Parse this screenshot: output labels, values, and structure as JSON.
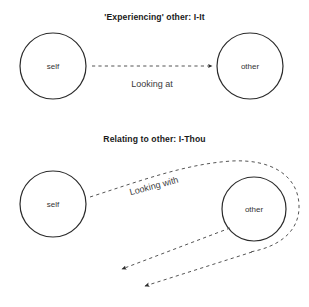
{
  "figure": {
    "background_color": "#ffffff",
    "stroke_color": "#2b2b2b",
    "dash_color": "#555555",
    "text_color": "#333333"
  },
  "panels": [
    {
      "id": "i-it",
      "title": "'Experiencing' other: I-It",
      "nodes": [
        {
          "id": "self-top",
          "label": "self",
          "cx": 53,
          "cy": 66,
          "r": 33
        },
        {
          "id": "other-top",
          "label": "other",
          "cx": 250,
          "cy": 66,
          "r": 33
        }
      ],
      "edges": [
        {
          "id": "looking-at",
          "label": "Looking at",
          "label_x": 152,
          "label_y": 84,
          "style": "dashed",
          "arrowhead": "end",
          "from": "self-top",
          "to": "other-top"
        }
      ]
    },
    {
      "id": "i-thou",
      "title": "Relating to other: I-Thou",
      "nodes": [
        {
          "id": "self-bottom",
          "label": "self",
          "cx": 53,
          "cy": 204,
          "r": 33
        },
        {
          "id": "other-bottom",
          "label": "other",
          "cx": 254,
          "cy": 209,
          "r": 32
        }
      ],
      "edges": [
        {
          "id": "looking-with",
          "label": "Looking with",
          "label_x": 154,
          "label_y": 186,
          "style": "dashed",
          "arrowhead": "end",
          "from": "self-bottom",
          "to": "loop-return"
        },
        {
          "id": "return-upper",
          "label": "",
          "style": "dashed",
          "arrowhead": "end",
          "from": "other-bottom",
          "to": "self-bottom"
        },
        {
          "id": "return-lower",
          "label": "",
          "style": "dashed",
          "arrowhead": "end",
          "from": "loop-outer",
          "to": "self-bottom"
        }
      ]
    }
  ]
}
